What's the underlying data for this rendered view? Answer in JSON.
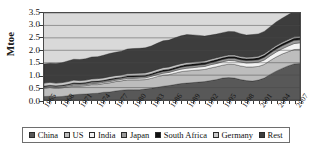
{
  "chart_data": {
    "type": "area",
    "stacked": true,
    "title": "",
    "xlabel": "",
    "ylabel": "Mtoe",
    "ylim": [
      0.0,
      3.5
    ],
    "ytick_labels": [
      "0.0",
      "0.5",
      "1.0",
      "1.5",
      "2.0",
      "2.5",
      "3.0",
      "3.5"
    ],
    "ytick_values": [
      0.0,
      0.5,
      1.0,
      1.5,
      2.0,
      2.5,
      3.0,
      3.5
    ],
    "grid": true,
    "legend_position": "bottom",
    "x": [
      1965,
      1966,
      1967,
      1968,
      1969,
      1970,
      1971,
      1972,
      1973,
      1974,
      1975,
      1976,
      1977,
      1978,
      1979,
      1980,
      1981,
      1982,
      1983,
      1984,
      1985,
      1986,
      1987,
      1988,
      1989,
      1990,
      1991,
      1992,
      1993,
      1994,
      1995,
      1996,
      1997,
      1998,
      1999,
      2000,
      2001,
      2002,
      2003,
      2004,
      2005,
      2006,
      2007,
      2008
    ],
    "xtick_labels": [
      "1965",
      "1968",
      "1971",
      "1974",
      "1977",
      "1980",
      "1983",
      "1986",
      "1989",
      "1992",
      "1995",
      "1998",
      "2001",
      "2004",
      "2007"
    ],
    "xtick_values": [
      1965,
      1968,
      1971,
      1974,
      1977,
      1980,
      1983,
      1986,
      1989,
      1992,
      1995,
      1998,
      2001,
      2004,
      2007
    ],
    "series": [
      {
        "name": "China",
        "color": "#585858",
        "values": [
          0.14,
          0.15,
          0.13,
          0.14,
          0.17,
          0.21,
          0.23,
          0.24,
          0.26,
          0.27,
          0.31,
          0.32,
          0.36,
          0.39,
          0.41,
          0.41,
          0.41,
          0.44,
          0.47,
          0.51,
          0.55,
          0.58,
          0.62,
          0.66,
          0.68,
          0.7,
          0.72,
          0.74,
          0.78,
          0.82,
          0.88,
          0.9,
          0.88,
          0.82,
          0.78,
          0.76,
          0.8,
          0.88,
          1.03,
          1.16,
          1.27,
          1.37,
          1.45,
          1.47
        ]
      },
      {
        "name": "US",
        "color": "#bdbdbd",
        "values": [
          0.33,
          0.35,
          0.34,
          0.35,
          0.35,
          0.35,
          0.33,
          0.34,
          0.36,
          0.35,
          0.35,
          0.37,
          0.38,
          0.38,
          0.4,
          0.4,
          0.4,
          0.38,
          0.4,
          0.43,
          0.44,
          0.44,
          0.46,
          0.48,
          0.49,
          0.49,
          0.49,
          0.49,
          0.51,
          0.52,
          0.52,
          0.54,
          0.55,
          0.55,
          0.55,
          0.57,
          0.55,
          0.55,
          0.56,
          0.57,
          0.58,
          0.57,
          0.58,
          0.57
        ]
      },
      {
        "name": "India",
        "color": "#f2f2f2",
        "values": [
          0.03,
          0.03,
          0.03,
          0.03,
          0.04,
          0.04,
          0.04,
          0.04,
          0.04,
          0.05,
          0.05,
          0.05,
          0.05,
          0.06,
          0.06,
          0.06,
          0.07,
          0.07,
          0.08,
          0.08,
          0.09,
          0.09,
          0.1,
          0.1,
          0.11,
          0.11,
          0.12,
          0.12,
          0.13,
          0.13,
          0.14,
          0.15,
          0.15,
          0.16,
          0.16,
          0.17,
          0.17,
          0.18,
          0.19,
          0.2,
          0.21,
          0.23,
          0.24,
          0.26
        ]
      },
      {
        "name": "Japan",
        "color": "#9a9a9a",
        "values": [
          0.04,
          0.04,
          0.05,
          0.05,
          0.05,
          0.06,
          0.05,
          0.05,
          0.06,
          0.06,
          0.05,
          0.06,
          0.06,
          0.05,
          0.06,
          0.06,
          0.06,
          0.06,
          0.06,
          0.07,
          0.07,
          0.07,
          0.07,
          0.08,
          0.08,
          0.08,
          0.08,
          0.08,
          0.08,
          0.09,
          0.09,
          0.09,
          0.1,
          0.09,
          0.1,
          0.1,
          0.1,
          0.11,
          0.11,
          0.12,
          0.12,
          0.12,
          0.13,
          0.12
        ]
      },
      {
        "name": "South Africa",
        "color": "#101010",
        "values": [
          0.02,
          0.02,
          0.02,
          0.02,
          0.02,
          0.03,
          0.03,
          0.03,
          0.03,
          0.03,
          0.03,
          0.04,
          0.04,
          0.04,
          0.04,
          0.05,
          0.05,
          0.05,
          0.05,
          0.05,
          0.06,
          0.06,
          0.06,
          0.06,
          0.07,
          0.07,
          0.07,
          0.07,
          0.07,
          0.07,
          0.07,
          0.07,
          0.07,
          0.07,
          0.07,
          0.07,
          0.08,
          0.08,
          0.08,
          0.08,
          0.08,
          0.08,
          0.08,
          0.08
        ]
      },
      {
        "name": "Germany",
        "color": "#c9c9c9",
        "values": [
          0.12,
          0.12,
          0.11,
          0.11,
          0.11,
          0.11,
          0.1,
          0.1,
          0.1,
          0.1,
          0.1,
          0.1,
          0.09,
          0.09,
          0.09,
          0.09,
          0.09,
          0.09,
          0.09,
          0.09,
          0.09,
          0.09,
          0.09,
          0.08,
          0.08,
          0.08,
          0.07,
          0.07,
          0.07,
          0.07,
          0.06,
          0.06,
          0.06,
          0.06,
          0.06,
          0.06,
          0.06,
          0.06,
          0.06,
          0.06,
          0.06,
          0.06,
          0.06,
          0.06
        ]
      },
      {
        "name": "Rest",
        "color": "#3d3d3d",
        "values": [
          0.77,
          0.77,
          0.79,
          0.8,
          0.83,
          0.84,
          0.85,
          0.86,
          0.88,
          0.88,
          0.91,
          0.93,
          0.94,
          0.95,
          0.99,
          1.0,
          1.0,
          1.01,
          1.02,
          1.05,
          1.08,
          1.08,
          1.1,
          1.12,
          1.12,
          1.09,
          1.05,
          1.0,
          0.97,
          0.95,
          0.95,
          0.95,
          0.94,
          0.92,
          0.89,
          0.9,
          0.9,
          0.9,
          0.92,
          0.95,
          0.97,
          1.0,
          1.03,
          1.05
        ]
      }
    ]
  },
  "legend": {
    "items": [
      {
        "label": "China"
      },
      {
        "label": "US"
      },
      {
        "label": "India"
      },
      {
        "label": "Japan"
      },
      {
        "label": "South Africa"
      },
      {
        "label": "Germany"
      },
      {
        "label": "Rest"
      }
    ]
  }
}
